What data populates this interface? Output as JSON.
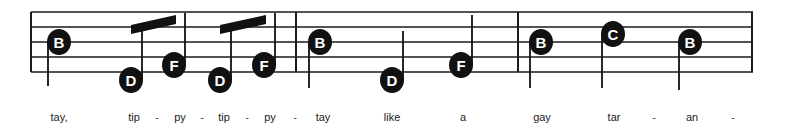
{
  "staff": {
    "left": 31,
    "right": 753,
    "top": 12,
    "line_spacing": 15,
    "line_count": 5,
    "line_color": "#1a1a1a",
    "line_width": 1.6
  },
  "barlines": [
    {
      "name": "barline-start",
      "x": 31
    },
    {
      "name": "barline-1",
      "x": 296
    },
    {
      "name": "barline-2",
      "x": 518
    },
    {
      "name": "barline-end",
      "x": 752
    }
  ],
  "notes": [
    {
      "id": "n1",
      "label": "B",
      "x": 59,
      "y": 42,
      "stem": "down",
      "stem_len": 44,
      "measure": 1
    },
    {
      "id": "n2",
      "label": "D",
      "x": 131,
      "y": 80,
      "stem": "up",
      "stem_len": 57,
      "measure": 1,
      "beam": "a"
    },
    {
      "id": "n3",
      "label": "F",
      "x": 174,
      "y": 65,
      "stem": "up",
      "stem_len": 52,
      "measure": 1,
      "beam": "a"
    },
    {
      "id": "n4",
      "label": "D",
      "x": 220,
      "y": 80,
      "stem": "up",
      "stem_len": 57,
      "measure": 1,
      "beam": "b"
    },
    {
      "id": "n5",
      "label": "F",
      "x": 264,
      "y": 65,
      "stem": "up",
      "stem_len": 52,
      "measure": 1,
      "beam": "b"
    },
    {
      "id": "n6",
      "label": "B",
      "x": 320,
      "y": 42,
      "stem": "down",
      "stem_len": 46,
      "measure": 2
    },
    {
      "id": "n7",
      "label": "D",
      "x": 392,
      "y": 80,
      "stem": "up",
      "stem_len": 49,
      "measure": 2
    },
    {
      "id": "n8",
      "label": "F",
      "x": 461,
      "y": 65,
      "stem": "up",
      "stem_len": 50,
      "measure": 2
    },
    {
      "id": "n9",
      "label": "B",
      "x": 541,
      "y": 42,
      "stem": "down",
      "stem_len": 46,
      "measure": 3
    },
    {
      "id": "n10",
      "label": "C",
      "x": 613,
      "y": 34,
      "stem": "down",
      "stem_len": 54,
      "measure": 3
    },
    {
      "id": "n11",
      "label": "B",
      "x": 690,
      "y": 42,
      "stem": "down",
      "stem_len": 48,
      "measure": 3
    }
  ],
  "beams": [
    {
      "id": "a",
      "x1": 131,
      "y1": 25,
      "x2": 176,
      "y2": 15,
      "thickness": 9
    },
    {
      "id": "b",
      "x1": 220,
      "y1": 25,
      "x2": 266,
      "y2": 15,
      "thickness": 9
    }
  ],
  "notehead": {
    "rx": 12,
    "ry": 13,
    "fill": "#111111",
    "text_color": "#ffffff",
    "font_size": 15
  },
  "lyrics": {
    "baseline_y": 122,
    "items": [
      {
        "text": "tay,",
        "x": 59,
        "type": "syllable"
      },
      {
        "text": "tip",
        "x": 134,
        "type": "syllable"
      },
      {
        "text": "-",
        "x": 157,
        "type": "hyphen"
      },
      {
        "text": "py",
        "x": 180,
        "type": "syllable"
      },
      {
        "text": "-",
        "x": 202,
        "type": "hyphen"
      },
      {
        "text": "tip",
        "x": 224,
        "type": "syllable"
      },
      {
        "text": "-",
        "x": 247,
        "type": "hyphen"
      },
      {
        "text": "py",
        "x": 270,
        "type": "syllable"
      },
      {
        "text": "-",
        "x": 295,
        "type": "hyphen"
      },
      {
        "text": "tay",
        "x": 323,
        "type": "syllable"
      },
      {
        "text": "like",
        "x": 392,
        "type": "syllable"
      },
      {
        "text": "a",
        "x": 463,
        "type": "syllable"
      },
      {
        "text": "gay",
        "x": 542,
        "type": "syllable"
      },
      {
        "text": "tar",
        "x": 614,
        "type": "syllable"
      },
      {
        "text": "-",
        "x": 654,
        "type": "hyphen"
      },
      {
        "text": "an",
        "x": 692,
        "type": "syllable"
      },
      {
        "text": "-",
        "x": 733,
        "type": "hyphen"
      }
    ]
  }
}
